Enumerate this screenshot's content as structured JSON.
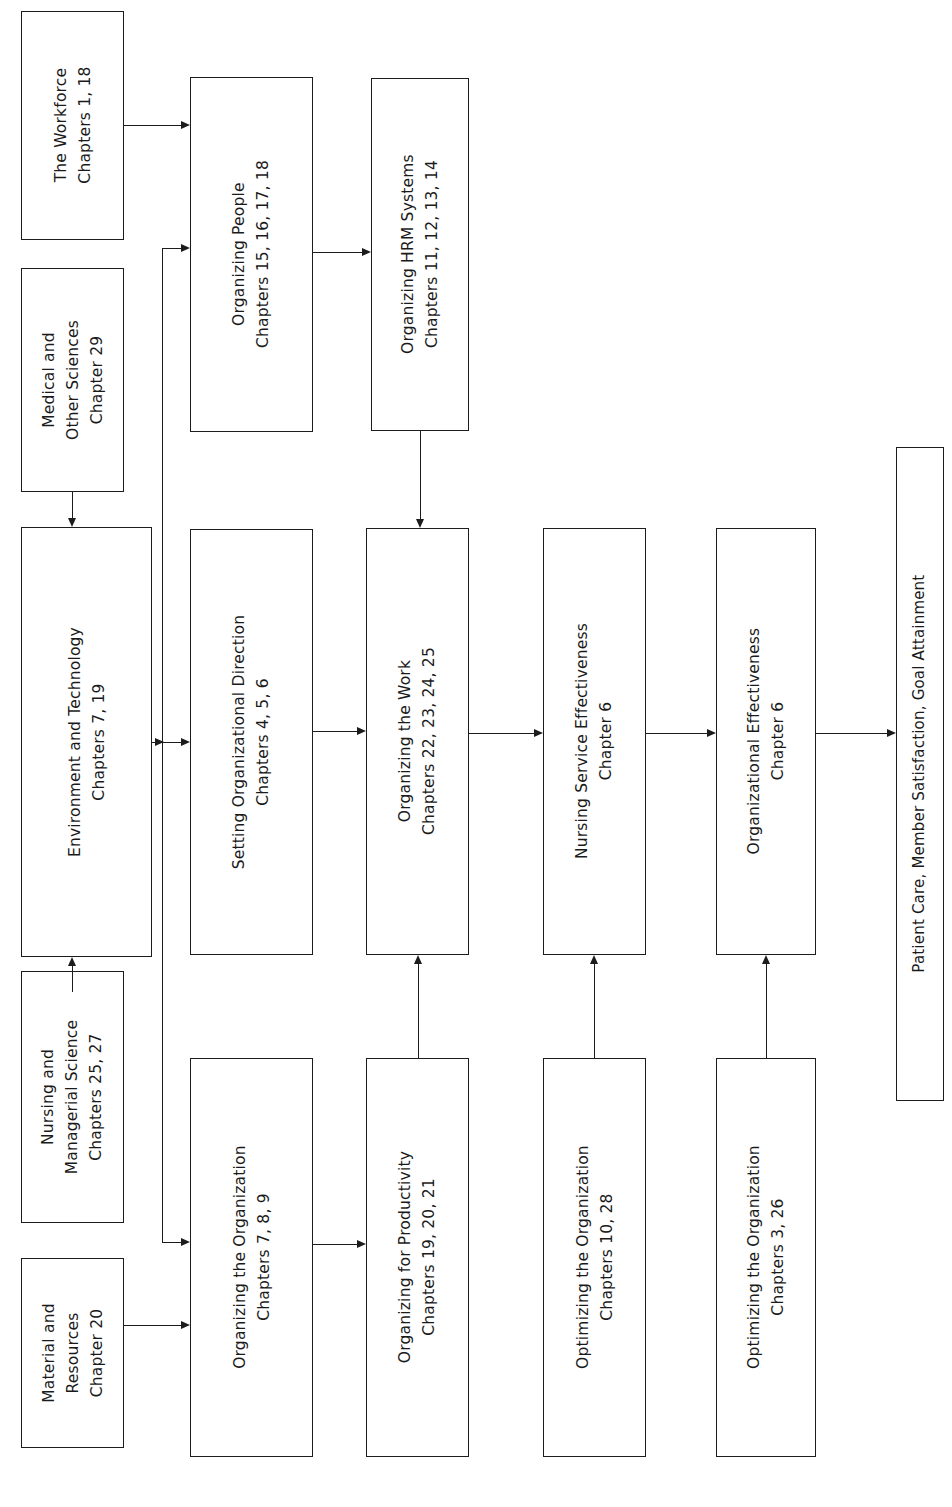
{
  "diagram": {
    "orientation": "text rotated 90 degrees counter-clockwise (reads bottom-to-top)",
    "line_color": "#1c1c1c",
    "background_color": "#ffffff",
    "nodes": [
      {
        "id": "workforce",
        "title": "The Workforce",
        "sub": "Chapters 1, 18",
        "lines": [
          "The Workforce",
          "Chapters 1, 18"
        ]
      },
      {
        "id": "medical-sciences",
        "title": "Medical and Other Sciences",
        "sub": "Chapter 29",
        "lines": [
          "Medical and",
          "Other Sciences",
          "Chapter 29"
        ]
      },
      {
        "id": "environment-tech",
        "title": "Environment and Technology",
        "sub": "Chapters 7, 19",
        "lines": [
          "Environment and Technology",
          "Chapters 7, 19"
        ]
      },
      {
        "id": "nursing-mgmt-sci",
        "title": "Nursing and Managerial Science",
        "sub": "Chapters 25, 27",
        "lines": [
          "Nursing and",
          "Managerial Science",
          "Chapters 25, 27"
        ]
      },
      {
        "id": "material-res",
        "title": "Material and Resources",
        "sub": "Chapter 20",
        "lines": [
          "Material and",
          "Resources",
          "Chapter 20"
        ]
      },
      {
        "id": "org-people",
        "title": "Organizing People",
        "sub": "Chapters 15, 16, 17, 18",
        "lines": [
          "Organizing People",
          "Chapters 15, 16, 17, 18"
        ]
      },
      {
        "id": "org-hrm",
        "title": "Organizing HRM Systems",
        "sub": "Chapters 11, 12, 13, 14",
        "lines": [
          "Organizing HRM Systems",
          "Chapters 11, 12, 13, 14"
        ]
      },
      {
        "id": "setting-dir",
        "title": "Setting Organizational Direction",
        "sub": "Chapters 4, 5, 6",
        "lines": [
          "Setting Organizational Direction",
          "Chapters 4, 5, 6"
        ]
      },
      {
        "id": "org-work",
        "title": "Organizing the Work",
        "sub": "Chapters 22, 23, 24, 25",
        "lines": [
          "Organizing the Work",
          "Chapters 22, 23, 24, 25"
        ]
      },
      {
        "id": "nursing-svc-eff",
        "title": "Nursing Service Effectiveness",
        "sub": "Chapter 6",
        "lines": [
          "Nursing Service Effectiveness",
          "Chapter 6"
        ]
      },
      {
        "id": "org-eff",
        "title": "Organizational Effectiveness",
        "sub": "Chapter 6",
        "lines": [
          "Organizational Effectiveness",
          "Chapter 6"
        ]
      },
      {
        "id": "org-org",
        "title": "Organizing the Organization",
        "sub": "Chapters 7, 8, 9",
        "lines": [
          "Organizing the Organization",
          "Chapters 7, 8, 9"
        ]
      },
      {
        "id": "org-productivity",
        "title": "Organizing for Productivity",
        "sub": "Chapters 19, 20, 21",
        "lines": [
          "Organizing for Productivity",
          "Chapters 19, 20, 21"
        ]
      },
      {
        "id": "optimizing-10-28",
        "title": "Optimizing the Organization",
        "sub": "Chapters 10, 28",
        "lines": [
          "Optimizing the Organization",
          "Chapters 10, 28"
        ]
      },
      {
        "id": "optimizing-3-26",
        "title": "Optimizing the Organization",
        "sub": "Chapters 3, 26",
        "lines": [
          "Optimizing the Organization",
          "Chapters 3, 26"
        ]
      },
      {
        "id": "outcomes",
        "title": "Patient Care, Member Satisfaction, Goal Attainment",
        "sub": "",
        "lines": [
          "Patient Care, Member Satisfaction, Goal Attainment"
        ]
      }
    ],
    "edges": [
      {
        "from": "workforce",
        "to": "org-people"
      },
      {
        "from": "medical-sciences",
        "to": "environment-tech"
      },
      {
        "from": "nursing-mgmt-sci",
        "to": "environment-tech"
      },
      {
        "from": "environment-tech",
        "to": "org-people"
      },
      {
        "from": "environment-tech",
        "to": "setting-dir"
      },
      {
        "from": "environment-tech",
        "to": "org-org"
      },
      {
        "from": "material-res",
        "to": "org-org"
      },
      {
        "from": "org-people",
        "to": "org-hrm"
      },
      {
        "from": "org-hrm",
        "to": "org-work"
      },
      {
        "from": "setting-dir",
        "to": "org-work"
      },
      {
        "from": "org-org",
        "to": "org-productivity"
      },
      {
        "from": "org-productivity",
        "to": "org-work"
      },
      {
        "from": "org-work",
        "to": "nursing-svc-eff"
      },
      {
        "from": "optimizing-10-28",
        "to": "nursing-svc-eff"
      },
      {
        "from": "nursing-svc-eff",
        "to": "org-eff"
      },
      {
        "from": "optimizing-3-26",
        "to": "org-eff"
      },
      {
        "from": "org-eff",
        "to": "outcomes"
      }
    ]
  }
}
